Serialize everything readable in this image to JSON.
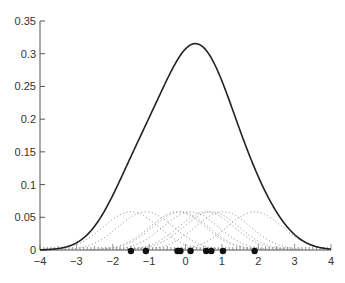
{
  "chart_data": {
    "type": "line",
    "title": "",
    "xlabel": "",
    "ylabel": "",
    "xlim": [
      -4,
      4
    ],
    "ylim": [
      0,
      0.35
    ],
    "grid": false,
    "legend": null,
    "x_ticks": [
      -4,
      -3,
      -2,
      -1,
      0,
      1,
      2,
      3,
      4
    ],
    "x_tick_labels": [
      "−4",
      "−3",
      "−2",
      "−1",
      "0",
      "1",
      "2",
      "3",
      "4"
    ],
    "y_ticks": [
      0,
      0.05,
      0.1,
      0.15,
      0.2,
      0.25,
      0.3,
      0.35
    ],
    "y_tick_labels": [
      "0",
      "0.05",
      "0.1",
      "0.15",
      "0.2",
      "0.25",
      "0.3",
      "0.35"
    ],
    "data_points": [
      -1.5,
      -1.09,
      -0.22,
      -0.14,
      0.14,
      0.57,
      0.71,
      1.03,
      1.9
    ],
    "bandwidth": 0.76,
    "kernel_peak": 0.058,
    "kde_peak": {
      "x": 0.1,
      "y": 0.3
    },
    "series": [
      {
        "name": "KDE",
        "style": "solid",
        "color": "#222222"
      },
      {
        "name": "Individual kernels",
        "style": "dotted",
        "color": "#777777"
      },
      {
        "name": "Data points",
        "style": "markers",
        "color": "#111111"
      }
    ]
  }
}
